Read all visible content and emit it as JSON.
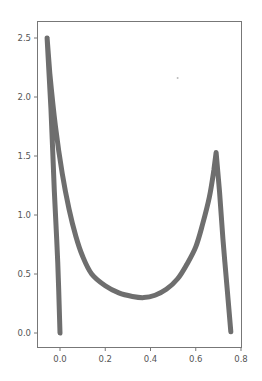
{
  "chart_data": {
    "type": "line",
    "title": "",
    "xlabel": "",
    "ylabel": "",
    "xlim": [
      -0.08,
      0.8
    ],
    "ylim": [
      -0.12,
      2.62
    ],
    "grid": false,
    "legend": null,
    "xticks": [
      "0.0",
      "0.2",
      "0.4",
      "0.6",
      "0.8"
    ],
    "yticks": [
      "0.0",
      "0.5",
      "1.0",
      "1.5",
      "2.0",
      "2.5"
    ],
    "line_color": "#6e6e6e",
    "line_width": 5,
    "series": [
      {
        "name": "curve",
        "x": [
          0.0,
          -0.01,
          -0.025,
          -0.04,
          -0.057,
          -0.045,
          -0.02,
          0.01,
          0.04,
          0.07,
          0.1,
          0.14,
          0.2,
          0.26,
          0.32,
          0.37,
          0.42,
          0.47,
          0.52,
          0.56,
          0.6,
          0.63,
          0.66,
          0.68,
          0.69,
          0.705,
          0.72,
          0.74,
          0.755
        ],
        "y": [
          0.0,
          0.6,
          1.2,
          1.9,
          2.5,
          2.2,
          1.75,
          1.35,
          1.05,
          0.82,
          0.65,
          0.5,
          0.4,
          0.34,
          0.31,
          0.3,
          0.32,
          0.37,
          0.46,
          0.58,
          0.73,
          0.92,
          1.15,
          1.38,
          1.53,
          1.2,
          0.8,
          0.35,
          0.01
        ]
      }
    ],
    "annotations": [
      {
        "type": "point",
        "x": 0.52,
        "y": 2.16,
        "note": "faint stray marker"
      }
    ]
  },
  "axes": {
    "x_tick_labels": [
      "0.0",
      "0.2",
      "0.4",
      "0.6",
      "0.8"
    ],
    "y_tick_labels": [
      "0.0",
      "0.5",
      "1.0",
      "1.5",
      "2.0",
      "2.5"
    ]
  }
}
